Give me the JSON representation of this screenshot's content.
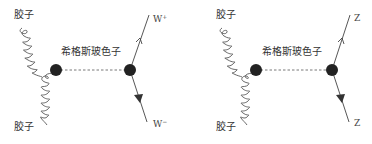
{
  "diagrams": [
    {
      "id": "gg-to-WW",
      "gluon_top_label": "胶子",
      "gluon_bottom_label": "胶子",
      "propagator_label": "希格斯玻色子",
      "outgoing_top": {
        "symbol": "W",
        "charge": "+"
      },
      "outgoing_bottom": {
        "symbol": "W",
        "charge": "−"
      }
    },
    {
      "id": "gg-to-ZZ",
      "gluon_top_label": "胶子",
      "gluon_bottom_label": "胶子",
      "propagator_label": "希格斯玻色子",
      "outgoing_top": {
        "symbol": "Z",
        "charge": ""
      },
      "outgoing_bottom": {
        "symbol": "Z",
        "charge": ""
      }
    }
  ],
  "colors": {
    "line": "#444444",
    "vertex": "#222222",
    "text": "#333333"
  }
}
